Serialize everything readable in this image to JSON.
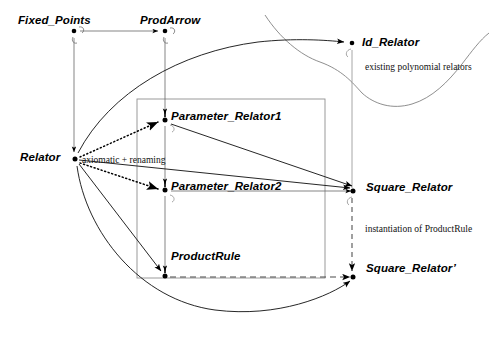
{
  "diagram": {
    "colors": {
      "ink": "#000000",
      "thin_rule": "#6f6f6f",
      "box_border": "#8a8a8a",
      "dashed": "#4a4a4a"
    },
    "nodes": [
      {
        "id": "fixed_points",
        "label": "Fixed_Points",
        "x": 74,
        "y": 33,
        "label_x": 18,
        "label_y": 14,
        "loop": true
      },
      {
        "id": "prodarrow",
        "label": "ProdArrow",
        "x": 165,
        "y": 33,
        "label_x": 140,
        "label_y": 14,
        "loop": true
      },
      {
        "id": "id_relator",
        "label": "Id_Relator",
        "x": 352,
        "y": 44,
        "label_x": 362,
        "label_y": 36,
        "loop": true
      },
      {
        "id": "relator",
        "label": "Relator",
        "x": 74,
        "y": 158,
        "label_x": 20,
        "label_y": 151,
        "loop": false
      },
      {
        "id": "parameter_relator1",
        "label": "Parameter_Relator1",
        "x": 165,
        "y": 120,
        "label_x": 171,
        "label_y": 110,
        "loop": true
      },
      {
        "id": "parameter_relator2",
        "label": "Parameter_Relator2",
        "x": 165,
        "y": 190,
        "label_x": 171,
        "label_y": 180,
        "loop": true
      },
      {
        "id": "square_relator",
        "label": "Square_Relator",
        "x": 358,
        "y": 190,
        "label_x": 366,
        "label_y": 181,
        "loop": true
      },
      {
        "id": "productrule",
        "label": "ProductRule",
        "x": 165,
        "y": 277,
        "label_x": 171,
        "label_y": 250,
        "loop": false
      },
      {
        "id": "square_relator_prime",
        "label": "Square_Relator’",
        "x": 358,
        "y": 277,
        "label_x": 366,
        "label_y": 262,
        "loop": false
      }
    ],
    "annotations": [
      {
        "id": "axiomatic_renaming",
        "text": "axiomatic + renaming",
        "x": 82,
        "y": 155
      },
      {
        "id": "existing_polynomial",
        "text": "existing polynomial relators",
        "x": 365,
        "y": 62
      },
      {
        "id": "instantiation_productrule",
        "text": "instantiation of ProductRule",
        "x": 365,
        "y": 224
      }
    ],
    "edges": [
      {
        "id": "fixed-points-to-prodarrow",
        "style": "solid-thin",
        "kind": "arrow"
      },
      {
        "id": "fixed-points-to-relator",
        "style": "solid-thin",
        "kind": "arrow"
      },
      {
        "id": "prodarrow-to-parameter-relator1",
        "style": "solid-thin",
        "kind": "arrow"
      },
      {
        "id": "parameter-relator1-to-parameter-relator2",
        "style": "solid-thin",
        "kind": "arrow"
      },
      {
        "id": "parameter-relator2-to-productrule",
        "style": "solid-thin",
        "kind": "arrow"
      },
      {
        "id": "relator-to-parameter-relator1",
        "style": "dotted",
        "kind": "arrow"
      },
      {
        "id": "relator-to-parameter-relator2",
        "style": "dotted",
        "kind": "arrow"
      },
      {
        "id": "relator-to-square-relator-line",
        "style": "solid",
        "kind": "arrow"
      },
      {
        "id": "relator-to-productrule",
        "style": "solid",
        "kind": "arrow"
      },
      {
        "id": "relator-to-id-relator-curve",
        "style": "solid-curve",
        "kind": "arrow"
      },
      {
        "id": "relator-to-square-relator-prime-curve",
        "style": "solid-curve",
        "kind": "arrow"
      },
      {
        "id": "parameter-relator1-to-square-relator",
        "style": "solid",
        "kind": "arrow"
      },
      {
        "id": "parameter-relator2-to-square-relator",
        "style": "solid-thin",
        "kind": "arrow"
      },
      {
        "id": "productrule-to-square-relator-prime",
        "style": "dashed",
        "kind": "arrow"
      },
      {
        "id": "square-relator-to-square-relator-prime",
        "style": "dashed-vertical",
        "kind": "arrow"
      }
    ],
    "regions": [
      {
        "id": "parameter-box",
        "kind": "rectangle",
        "x": 137,
        "y": 99,
        "width": 188,
        "height": 179
      },
      {
        "id": "existing-relators-blob",
        "kind": "freeform-curve"
      }
    ]
  }
}
